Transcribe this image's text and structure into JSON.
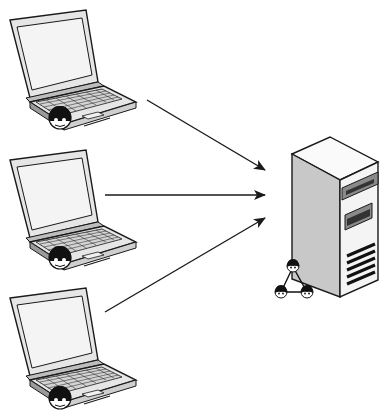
{
  "diagram": {
    "title": "",
    "colors": {
      "stroke": "#1a1a1a",
      "screen": "#f2f2f2",
      "body": "#e6e6e6",
      "shade": "#bdbdbd",
      "server_side": "#c8c8c8",
      "server_front": "#f4f4f4",
      "server_top": "#fafafa",
      "slot": "#333333",
      "slot_frame": "#8a8a8a",
      "user_dark": "#111111",
      "user_face": "#ffffff"
    },
    "nodes": [
      {
        "id": "client-1",
        "type": "laptop",
        "has_user": true
      },
      {
        "id": "client-2",
        "type": "laptop",
        "has_user": true
      },
      {
        "id": "client-3",
        "type": "laptop",
        "has_user": true
      },
      {
        "id": "server",
        "type": "server-tower",
        "badge": "user-group"
      }
    ],
    "edges": [
      {
        "from": "client-1",
        "to": "server",
        "directed": true
      },
      {
        "from": "client-2",
        "to": "server",
        "directed": true
      },
      {
        "from": "client-3",
        "to": "server",
        "directed": true
      }
    ]
  }
}
